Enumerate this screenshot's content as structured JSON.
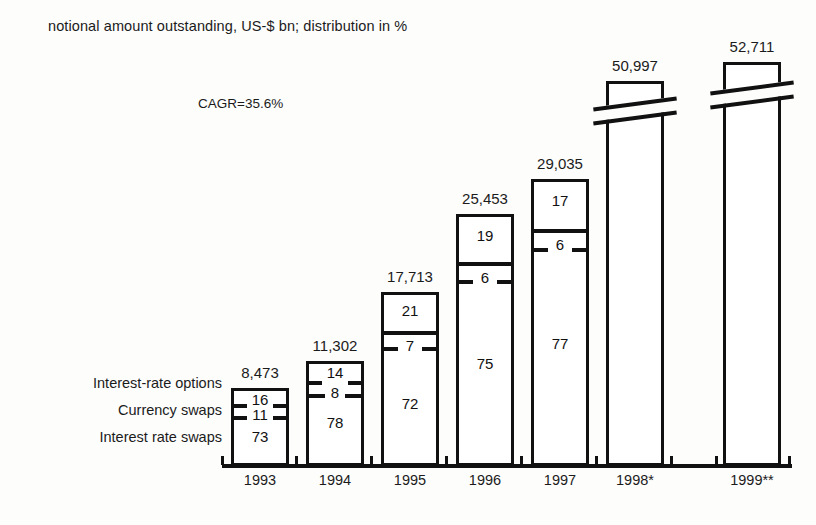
{
  "header": {
    "title": "notional amount outstanding, US-$ bn; distribution in %"
  },
  "annotation": {
    "cagr": "CAGR=35.6%"
  },
  "legend": {
    "items": [
      {
        "label": "Interest-rate options"
      },
      {
        "label": "Currency swaps"
      },
      {
        "label": "Interest rate swaps"
      }
    ]
  },
  "footnote_markers": {
    "single": "*",
    "double": "**"
  },
  "chart_data": {
    "type": "bar",
    "subtype": "stacked-bar",
    "title": "notional amount outstanding, US-$ bn; distribution in %",
    "xlabel": "",
    "ylabel": "",
    "grid": false,
    "legend_position": "left",
    "annotations": [
      "CAGR=35.6%"
    ],
    "categories": [
      "1993",
      "1994",
      "1995",
      "1996",
      "1997",
      "1998*",
      "1999**"
    ],
    "totals": [
      8473,
      11302,
      17713,
      25453,
      29035,
      50997,
      52711
    ],
    "totals_labels": [
      "8,473",
      "11,302",
      "17,713",
      "25,453",
      "29,035",
      "50,997",
      "52,711"
    ],
    "unit": "US-$ bn",
    "distribution_unit": "%",
    "truncated_bars": [
      "1998*",
      "1999**"
    ],
    "series": [
      {
        "name": "Interest-rate options",
        "values": [
          16,
          14,
          21,
          19,
          17,
          null,
          null
        ],
        "labels": [
          "16",
          "14",
          "21",
          "19",
          "17",
          "",
          ""
        ]
      },
      {
        "name": "Currency swaps",
        "values": [
          11,
          8,
          7,
          6,
          6,
          null,
          null
        ],
        "labels": [
          "11",
          "8",
          "7",
          "6",
          "6",
          "",
          ""
        ]
      },
      {
        "name": "Interest rate swaps",
        "values": [
          73,
          78,
          72,
          75,
          77,
          null,
          null
        ],
        "labels": [
          "73",
          "78",
          "72",
          "75",
          "77",
          "",
          ""
        ]
      }
    ],
    "bars": [
      {
        "category": "1993",
        "total_label": "8,473",
        "x": 231,
        "width": 58,
        "top": 388,
        "bottom": 466,
        "truncated": false,
        "dividers": [
          {
            "y": 404,
            "style": "ticks",
            "tick_len": 13
          },
          {
            "y": 416,
            "style": "ticks",
            "tick_len": 13
          }
        ],
        "segments": [
          {
            "label": "16",
            "label_y": 391
          },
          {
            "label": "11",
            "label_y": 406
          },
          {
            "label": "73",
            "label_y": 428
          }
        ]
      },
      {
        "category": "1994",
        "total_label": "11,302",
        "x": 306,
        "width": 58,
        "top": 361,
        "bottom": 466,
        "truncated": false,
        "dividers": [
          {
            "y": 381,
            "style": "ticks",
            "tick_len": 13
          },
          {
            "y": 394,
            "style": "ticks",
            "tick_len": 16
          }
        ],
        "segments": [
          {
            "label": "14",
            "label_y": 364
          },
          {
            "label": "8",
            "label_y": 384
          },
          {
            "label": "78",
            "label_y": 414
          }
        ]
      },
      {
        "category": "1995",
        "total_label": "17,713",
        "x": 381,
        "width": 58,
        "top": 292,
        "bottom": 466,
        "truncated": false,
        "dividers": [
          {
            "y": 331,
            "style": "full"
          },
          {
            "y": 347,
            "style": "ticks",
            "tick_len": 14
          }
        ],
        "segments": [
          {
            "label": "21",
            "label_y": 302
          },
          {
            "label": "7",
            "label_y": 337
          },
          {
            "label": "72",
            "label_y": 395
          }
        ]
      },
      {
        "category": "1996",
        "total_label": "25,453",
        "x": 456,
        "width": 58,
        "top": 214,
        "bottom": 466,
        "truncated": false,
        "dividers": [
          {
            "y": 262,
            "style": "full"
          },
          {
            "y": 280,
            "style": "ticks",
            "tick_len": 14
          }
        ],
        "segments": [
          {
            "label": "19",
            "label_y": 227
          },
          {
            "label": "6",
            "label_y": 269
          },
          {
            "label": "75",
            "label_y": 355
          }
        ]
      },
      {
        "category": "1997",
        "total_label": "29,035",
        "x": 531,
        "width": 58,
        "top": 179,
        "bottom": 466,
        "truncated": false,
        "dividers": [
          {
            "y": 229,
            "style": "full"
          },
          {
            "y": 248,
            "style": "ticks",
            "tick_len": 14
          }
        ],
        "segments": [
          {
            "label": "17",
            "label_y": 192
          },
          {
            "label": "6",
            "label_y": 236
          },
          {
            "label": "77",
            "label_y": 335
          }
        ]
      },
      {
        "category": "1998*",
        "total_label": "50,997",
        "x": 606,
        "width": 58,
        "top": 81,
        "bottom": 466,
        "truncated": true,
        "break_y": 108,
        "dividers": [],
        "segments": []
      },
      {
        "category": "1999**",
        "total_label": "52,711",
        "x": 723,
        "width": 58,
        "top": 62,
        "bottom": 466,
        "truncated": true,
        "break_y": 92,
        "dividers": [],
        "segments": []
      }
    ],
    "axis": {
      "baseline_y": 464,
      "x_start": 222,
      "x_end": 792,
      "ticks_x": [
        222,
        296,
        371,
        446,
        521,
        596,
        671,
        716,
        789
      ]
    }
  }
}
